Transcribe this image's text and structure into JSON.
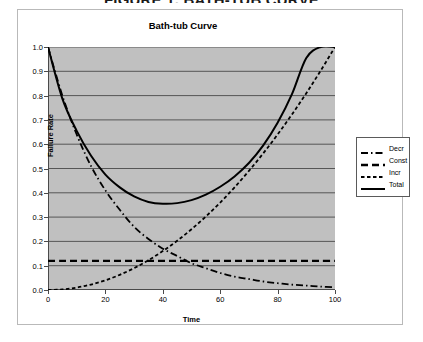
{
  "figure_header": "FIGURE 1. BATH-TUB CURVE",
  "chart_title": "Bath-tub Curve",
  "axis": {
    "xlabel": "Time",
    "ylabel": "Failure Rate"
  },
  "legend": {
    "items": [
      {
        "label": "Decr",
        "style": "dash-dot"
      },
      {
        "label": "Const",
        "style": "long-dash"
      },
      {
        "label": "Incr",
        "style": "short-dash"
      },
      {
        "label": "Total",
        "style": "solid"
      }
    ]
  },
  "colors": {
    "plot_background": "#c0c0c0",
    "gridline": "#4a4a4a",
    "curve": "#000000",
    "frame": "#b9b9b9",
    "page_background": "#ffffff"
  },
  "chart_data": {
    "type": "line",
    "title": "Bath-tub Curve",
    "xlabel": "Time",
    "ylabel": "Failure Rate",
    "xlim": [
      0,
      100
    ],
    "ylim": [
      0.0,
      1.0
    ],
    "xticks": [
      0,
      20,
      40,
      60,
      80,
      100
    ],
    "yticks": [
      0.0,
      0.1,
      0.2,
      0.3,
      0.4,
      0.5,
      0.6,
      0.7,
      0.8,
      0.9,
      1.0
    ],
    "grid": "horizontal",
    "legend_position": "right-outside",
    "x": [
      0,
      5,
      10,
      15,
      20,
      25,
      30,
      35,
      40,
      45,
      50,
      55,
      60,
      65,
      70,
      75,
      80,
      85,
      90,
      95,
      100
    ],
    "series": [
      {
        "name": "Decr",
        "style": "dash-dot",
        "values": [
          1.0,
          0.8,
          0.64,
          0.51,
          0.41,
          0.33,
          0.26,
          0.21,
          0.17,
          0.14,
          0.11,
          0.09,
          0.07,
          0.055,
          0.045,
          0.035,
          0.028,
          0.022,
          0.018,
          0.014,
          0.011
        ]
      },
      {
        "name": "Const",
        "style": "long-dash",
        "values": [
          0.12,
          0.12,
          0.12,
          0.12,
          0.12,
          0.12,
          0.12,
          0.12,
          0.12,
          0.12,
          0.12,
          0.12,
          0.12,
          0.12,
          0.12,
          0.12,
          0.12,
          0.12,
          0.12,
          0.12,
          0.12
        ]
      },
      {
        "name": "Incr",
        "style": "short-dash",
        "values": [
          0.0,
          0.0025,
          0.01,
          0.0225,
          0.04,
          0.0625,
          0.09,
          0.1225,
          0.16,
          0.2025,
          0.25,
          0.3025,
          0.36,
          0.4225,
          0.49,
          0.5625,
          0.64,
          0.7225,
          0.81,
          0.9025,
          1.0
        ]
      },
      {
        "name": "Total",
        "style": "solid",
        "values": [
          1.0,
          0.7875,
          0.655,
          0.5525,
          0.475,
          0.4225,
          0.385,
          0.3625,
          0.355,
          0.3575,
          0.37,
          0.3925,
          0.425,
          0.4675,
          0.5225,
          0.595,
          0.688,
          0.806,
          0.955,
          1.0,
          1.0
        ]
      }
    ]
  }
}
